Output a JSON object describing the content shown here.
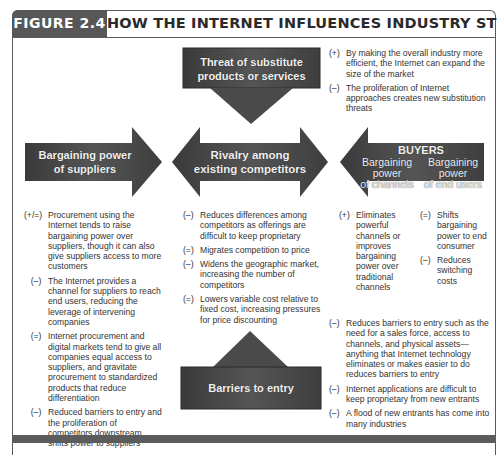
{
  "figure": {
    "tag": "FIGURE 2.4",
    "title": "HOW THE INTERNET INFLUENCES INDUSTRY STRUCTURE"
  },
  "colors": {
    "shape_fill": "#4a4a4a",
    "shape_dark": "#2e2e2e",
    "tag_bg": "#575757",
    "text": "#333333"
  },
  "forces": {
    "substitutes": {
      "label_line1": "Threat of substitute",
      "label_line2": "products or services",
      "effects": [
        {
          "sign": "(+)",
          "text": "By making the overall industry more efficient, the Internet can expand the size of the market"
        },
        {
          "sign": "(–)",
          "text": "The proliferation of Internet approaches creates new substitution threats"
        }
      ]
    },
    "suppliers": {
      "label_line1": "Bargaining power",
      "label_line2": "of suppliers",
      "effects": [
        {
          "sign": "(+/=)",
          "text": "Procurement using the Internet tends to raise bargaining power over suppliers, though it can also give suppliers access to more customers"
        },
        {
          "sign": "(–)",
          "text": "The Internet provides a channel for suppliers to reach end users, reducing the leverage of intervening companies"
        },
        {
          "sign": "(=)",
          "text": "Internet procurement and digital markets tend to give all companies equal access to suppliers, and gravitate procurement to standardized products that reduce differentiation"
        },
        {
          "sign": "(–)",
          "text": "Reduced barriers to entry and the proliferation of competitors downstream shifts power to suppliers"
        }
      ]
    },
    "rivalry": {
      "label_line1": "Rivalry among",
      "label_line2": "existing competitors",
      "effects": [
        {
          "sign": "(–)",
          "text": "Reduces differences among competitors as offerings are difficult to keep proprietary"
        },
        {
          "sign": "(=)",
          "text": "Migrates competition to price"
        },
        {
          "sign": "(–)",
          "text": "Widens the geographic market, increasing the number of competitors"
        },
        {
          "sign": "(=)",
          "text": "Lowers variable cost relative to fixed cost, increasing pressures for price discounting"
        }
      ]
    },
    "buyers": {
      "heading": "BUYERS",
      "channels_label_1": "Bargaining",
      "channels_label_2": "power",
      "channels_label_3": "of channels",
      "endusers_label_1": "Bargaining",
      "endusers_label_2": "power",
      "endusers_label_3": "of end users",
      "channels_effects": [
        {
          "sign": "(+)",
          "text": "Eliminates powerful channels or improves bargaining power over traditional channels"
        }
      ],
      "endusers_effects": [
        {
          "sign": "(=)",
          "text": "Shifts bargaining power to end consumer"
        },
        {
          "sign": "(–)",
          "text": "Reduces switching costs"
        }
      ]
    },
    "barriers": {
      "label": "Barriers to entry",
      "effects": [
        {
          "sign": "(–)",
          "text": "Reduces barriers to entry such as the need for a sales force, access to channels, and physical assets—anything that Internet technology eliminates or makes easier to do reduces barriers to entry"
        },
        {
          "sign": "(–)",
          "text": "Internet applications are difficult to keep proprietary from new entrants"
        },
        {
          "sign": "(–)",
          "text": "A flood of new entrants has come into many industries"
        }
      ]
    }
  }
}
